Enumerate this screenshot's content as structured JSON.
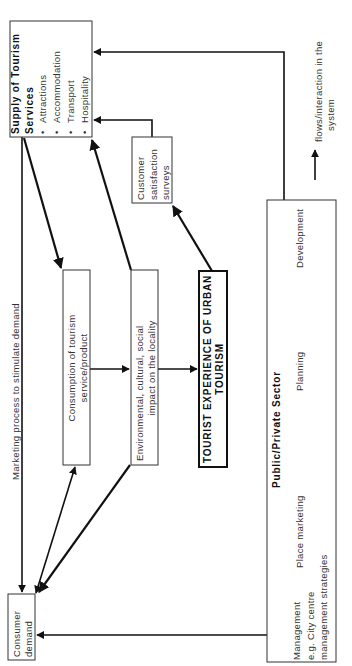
{
  "diagram": {
    "supply_box": {
      "title_line1": "Supply  of  Tourism",
      "title_line2": "Services",
      "items": [
        "Attractions",
        "Accommodation",
        "Transport",
        "Hospitality"
      ],
      "bullet": "•"
    },
    "customer_box": {
      "line1": "Customer",
      "line2": "satisfaction",
      "line3": "surveys"
    },
    "consumption_box": {
      "line1": "Consumption  of  tourism",
      "line2": "service/product"
    },
    "impact_box": {
      "line1": "Environmental,  cultural,  social",
      "line2": "impact  on  the  locality"
    },
    "experience_box": {
      "line1": "TOURIST EXPERIENCE OF URBAN",
      "line2": "TOURISM"
    },
    "demand_box": {
      "line1": "Consumer",
      "line2": "demand"
    },
    "sector_box": {
      "title": "Public/Private   Sector",
      "management_line1": "Management",
      "management_line2": "e.g.  City  centre",
      "management_line3": "management  strategies",
      "place_marketing": "Place  marketing",
      "planning": "Planning",
      "development": "Development"
    },
    "marketing_label": "Marketing  process  to  stimulate  demand",
    "legend": {
      "line1": "flows/interaction   in   the",
      "line2": "system"
    }
  }
}
